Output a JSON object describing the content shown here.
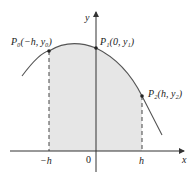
{
  "diagram": {
    "axes": {
      "x_label": "x",
      "y_label": "y",
      "origin_label": "0"
    },
    "ticks": {
      "left": "−h",
      "right": "h"
    },
    "points": [
      {
        "name": "P0",
        "label": "P₀(−h, y₀)"
      },
      {
        "name": "P1",
        "label": "P₁(0, y₁)"
      },
      {
        "name": "P2",
        "label": "P₂(h, y₂)"
      }
    ],
    "colors": {
      "curve": "#555555",
      "fill": "#e6e6e6",
      "axis": "#333333"
    }
  }
}
